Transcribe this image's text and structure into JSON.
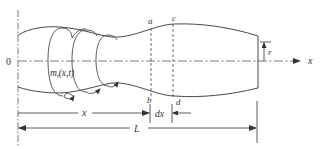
{
  "figure": {
    "labels": {
      "origin": "0",
      "axis_x": "x",
      "point_a": "a",
      "point_b": "b",
      "point_c": "c",
      "point_d": "d",
      "torque": "m",
      "torque_sub": "t",
      "torque_args": "(x,t)",
      "dim_x": "x",
      "dim_dx": "dx",
      "dim_L": "L",
      "radius": "r"
    },
    "colors": {
      "line": "#333333",
      "background": "#ffffff"
    }
  }
}
